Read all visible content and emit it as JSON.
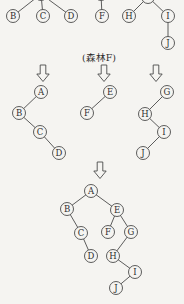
{
  "caption": {
    "text": "(森林F)"
  },
  "colors": {
    "ink": "#4b4b4b",
    "text": "#2e2e2e",
    "paper": "#f5f4f1"
  },
  "node_radius": 6.5,
  "graphs": [
    {
      "name": "forest-tree-1",
      "nodes": [
        {
          "id": "root",
          "label": "",
          "x": 41,
          "y": -6
        },
        {
          "id": "B",
          "label": "B",
          "x": 13,
          "y": 16
        },
        {
          "id": "C",
          "label": "C",
          "x": 43,
          "y": 16
        },
        {
          "id": "D",
          "label": "D",
          "x": 71,
          "y": 16
        }
      ],
      "edges": [
        [
          "root",
          "B"
        ],
        [
          "root",
          "C"
        ],
        [
          "root",
          "D"
        ]
      ]
    },
    {
      "name": "forest-tree-2",
      "nodes": [
        {
          "id": "root",
          "label": "",
          "x": 101,
          "y": -6
        },
        {
          "id": "F",
          "label": "F",
          "x": 102,
          "y": 16
        }
      ],
      "edges": [
        [
          "root",
          "F"
        ]
      ]
    },
    {
      "name": "forest-tree-3",
      "nodes": [
        {
          "id": "root",
          "label": "",
          "x": 148,
          "y": -3
        },
        {
          "id": "H",
          "label": "H",
          "x": 129,
          "y": 16
        },
        {
          "id": "I",
          "label": "I",
          "x": 168,
          "y": 16
        },
        {
          "id": "J",
          "label": "J",
          "x": 168,
          "y": 43
        }
      ],
      "edges": [
        [
          "root",
          "H"
        ],
        [
          "root",
          "I"
        ],
        [
          "I",
          "J"
        ]
      ]
    },
    {
      "name": "binary-subtree-A",
      "nodes": [
        {
          "id": "A",
          "label": "A",
          "x": 41,
          "y": 92
        },
        {
          "id": "B",
          "label": "B",
          "x": 19,
          "y": 113
        },
        {
          "id": "C",
          "label": "C",
          "x": 40,
          "y": 132
        },
        {
          "id": "D",
          "label": "D",
          "x": 59,
          "y": 153
        }
      ],
      "edges": [
        [
          "A",
          "B"
        ],
        [
          "B",
          "C"
        ],
        [
          "C",
          "D"
        ]
      ]
    },
    {
      "name": "binary-subtree-E",
      "nodes": [
        {
          "id": "E",
          "label": "E",
          "x": 110,
          "y": 92
        },
        {
          "id": "F",
          "label": "F",
          "x": 87,
          "y": 113
        }
      ],
      "edges": [
        [
          "E",
          "F"
        ]
      ]
    },
    {
      "name": "binary-subtree-G",
      "nodes": [
        {
          "id": "G",
          "label": "G",
          "x": 167,
          "y": 92
        },
        {
          "id": "H",
          "label": "H",
          "x": 145,
          "y": 114
        },
        {
          "id": "I",
          "label": "I",
          "x": 164,
          "y": 132
        },
        {
          "id": "J",
          "label": "J",
          "x": 143,
          "y": 153
        }
      ],
      "edges": [
        [
          "G",
          "H"
        ],
        [
          "H",
          "I"
        ],
        [
          "I",
          "J"
        ]
      ]
    },
    {
      "name": "merged-binary-tree",
      "nodes": [
        {
          "id": "A",
          "label": "A",
          "x": 91,
          "y": 191
        },
        {
          "id": "B",
          "label": "B",
          "x": 67,
          "y": 209
        },
        {
          "id": "E",
          "label": "E",
          "x": 117,
          "y": 210
        },
        {
          "id": "C",
          "label": "C",
          "x": 81,
          "y": 233
        },
        {
          "id": "F",
          "label": "F",
          "x": 108,
          "y": 232
        },
        {
          "id": "G",
          "label": "G",
          "x": 131,
          "y": 232
        },
        {
          "id": "D",
          "label": "D",
          "x": 91,
          "y": 256
        },
        {
          "id": "H",
          "label": "H",
          "x": 113,
          "y": 256
        },
        {
          "id": "I",
          "label": "I",
          "x": 135,
          "y": 272
        },
        {
          "id": "J",
          "label": "J",
          "x": 116,
          "y": 288
        }
      ],
      "edges": [
        [
          "A",
          "B"
        ],
        [
          "A",
          "E"
        ],
        [
          "B",
          "C"
        ],
        [
          "C",
          "D"
        ],
        [
          "E",
          "F"
        ],
        [
          "E",
          "G"
        ],
        [
          "G",
          "H"
        ],
        [
          "H",
          "I"
        ],
        [
          "I",
          "J"
        ]
      ]
    }
  ],
  "arrows": [
    {
      "x": 43,
      "y": 65
    },
    {
      "x": 104,
      "y": 65
    },
    {
      "x": 156,
      "y": 65
    },
    {
      "x": 100,
      "y": 162
    }
  ]
}
